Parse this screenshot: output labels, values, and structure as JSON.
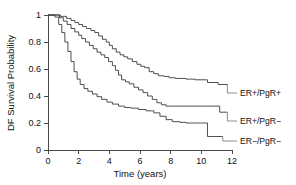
{
  "chart_data": {
    "type": "line",
    "title": "",
    "subtitle": "",
    "xlabel": "Time (years)",
    "ylabel": "DF Survival Probability",
    "xlim": [
      0,
      12
    ],
    "ylim": [
      0,
      1
    ],
    "xticks": [
      "0",
      "2",
      "4",
      "6",
      "8",
      "10",
      "12"
    ],
    "xtick_values": [
      0,
      2,
      4,
      6,
      8,
      10,
      12
    ],
    "yticks": [
      "0",
      "0.2",
      "0.4",
      "0.6",
      "0.8",
      "1"
    ],
    "ytick_values": [
      0,
      0.2,
      0.4,
      0.6,
      0.8,
      1
    ],
    "grid": false,
    "legend_position": "right-inline-labels",
    "curve_style": "kaplan-meier step",
    "annotations": [
      "ER+/PgR+",
      "ER+/PgR−",
      "ER−/PgR−"
    ],
    "series": [
      {
        "name": "ER+/PgR+",
        "label": "ER+/PgR+",
        "color": "#3c3c3c",
        "final_value": 0.48,
        "x": [
          0,
          0.55,
          0.8,
          1.2,
          1.5,
          1.75,
          2.0,
          2.25,
          2.5,
          2.8,
          3.05,
          3.3,
          3.55,
          3.8,
          4.0,
          4.2,
          4.45,
          4.7,
          4.95,
          5.2,
          5.5,
          5.8,
          6.05,
          6.3,
          6.6,
          6.9,
          7.2,
          7.55,
          7.9,
          8.3,
          9.0,
          9.6,
          10.4,
          11.1,
          11.7
        ],
        "y": [
          1.0,
          1.0,
          0.99,
          0.975,
          0.96,
          0.945,
          0.93,
          0.915,
          0.9,
          0.885,
          0.87,
          0.845,
          0.82,
          0.8,
          0.775,
          0.75,
          0.725,
          0.705,
          0.69,
          0.675,
          0.655,
          0.635,
          0.62,
          0.61,
          0.58,
          0.565,
          0.55,
          0.545,
          0.535,
          0.53,
          0.525,
          0.52,
          0.5,
          0.485,
          0.48
        ]
      },
      {
        "name": "ER+/PgR-",
        "label": "ER+/PgR−",
        "color": "#3c3c3c",
        "final_value": 0.28,
        "x": [
          0,
          0.5,
          0.75,
          1.0,
          1.25,
          1.5,
          1.75,
          2.0,
          2.2,
          2.45,
          2.7,
          2.95,
          3.2,
          3.45,
          3.7,
          3.95,
          4.2,
          4.4,
          4.6,
          4.8,
          5.05,
          5.3,
          5.6,
          5.9,
          6.2,
          6.5,
          6.8,
          7.1,
          7.4,
          7.7,
          8.2,
          9.0,
          10.0,
          10.9,
          11.2,
          11.7
        ],
        "y": [
          1.0,
          1.0,
          0.98,
          0.955,
          0.93,
          0.9,
          0.875,
          0.85,
          0.825,
          0.8,
          0.775,
          0.75,
          0.725,
          0.705,
          0.685,
          0.655,
          0.625,
          0.59,
          0.555,
          0.52,
          0.505,
          0.49,
          0.465,
          0.445,
          0.425,
          0.4,
          0.375,
          0.35,
          0.335,
          0.325,
          0.325,
          0.325,
          0.325,
          0.325,
          0.28,
          0.28
        ]
      },
      {
        "name": "ER-/PgR-",
        "label": "ER−/PgR−",
        "color": "#3c3c3c",
        "final_value": 0.1,
        "x": [
          0,
          0.45,
          0.7,
          0.9,
          1.1,
          1.3,
          1.5,
          1.7,
          1.9,
          2.1,
          2.35,
          2.6,
          2.9,
          3.2,
          3.5,
          3.85,
          4.2,
          4.6,
          5.0,
          5.4,
          5.9,
          6.4,
          6.9,
          7.3,
          7.7,
          8.1,
          8.6,
          9.0,
          9.5,
          10.0,
          10.4,
          10.8,
          11.4
        ],
        "y": [
          1.0,
          0.985,
          0.93,
          0.87,
          0.8,
          0.73,
          0.655,
          0.58,
          0.525,
          0.485,
          0.455,
          0.435,
          0.415,
          0.395,
          0.375,
          0.355,
          0.34,
          0.325,
          0.315,
          0.31,
          0.3,
          0.29,
          0.275,
          0.25,
          0.225,
          0.21,
          0.205,
          0.2,
          0.2,
          0.2,
          0.1,
          0.1,
          0.1
        ]
      }
    ]
  }
}
